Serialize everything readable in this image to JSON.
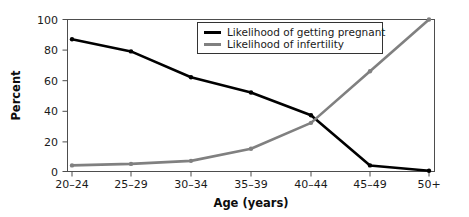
{
  "chart_data": {
    "type": "line",
    "title": "",
    "xlabel": "Age (years)",
    "ylabel": "Percent",
    "categories": [
      "20–24",
      "25–29",
      "30–34",
      "35–39",
      "40–44",
      "45–49",
      "50+"
    ],
    "ylim": [
      0,
      100
    ],
    "yticks": [
      0,
      20,
      40,
      60,
      80,
      100
    ],
    "grid": false,
    "legend_position": "top-center-right",
    "series": [
      {
        "name": "Likelihood of getting pregnant",
        "color": "#000000",
        "values": [
          87,
          79,
          62,
          52,
          37,
          4,
          0.5
        ]
      },
      {
        "name": "Likelihood of infertility",
        "color": "#808080",
        "values": [
          4,
          5,
          7,
          15,
          32,
          66,
          100
        ]
      }
    ]
  },
  "axes": {
    "ylabel": "Percent",
    "xlabel": "Age (years)",
    "ytick_labels": [
      "0",
      "20",
      "40",
      "60",
      "80",
      "100"
    ],
    "xtick_labels": [
      "20–24",
      "25–29",
      "30–34",
      "35–39",
      "40–44",
      "45–49",
      "50+"
    ]
  },
  "legend": {
    "items": [
      {
        "label": "Likelihood of getting pregnant",
        "color": "#000000"
      },
      {
        "label": "Likelihood of infertility",
        "color": "#808080"
      }
    ]
  },
  "colors": {
    "pregnant": "#000000",
    "infertility": "#808080",
    "frame": "#4d4d4d",
    "text": "#1a1a1a",
    "background": "#ffffff"
  }
}
